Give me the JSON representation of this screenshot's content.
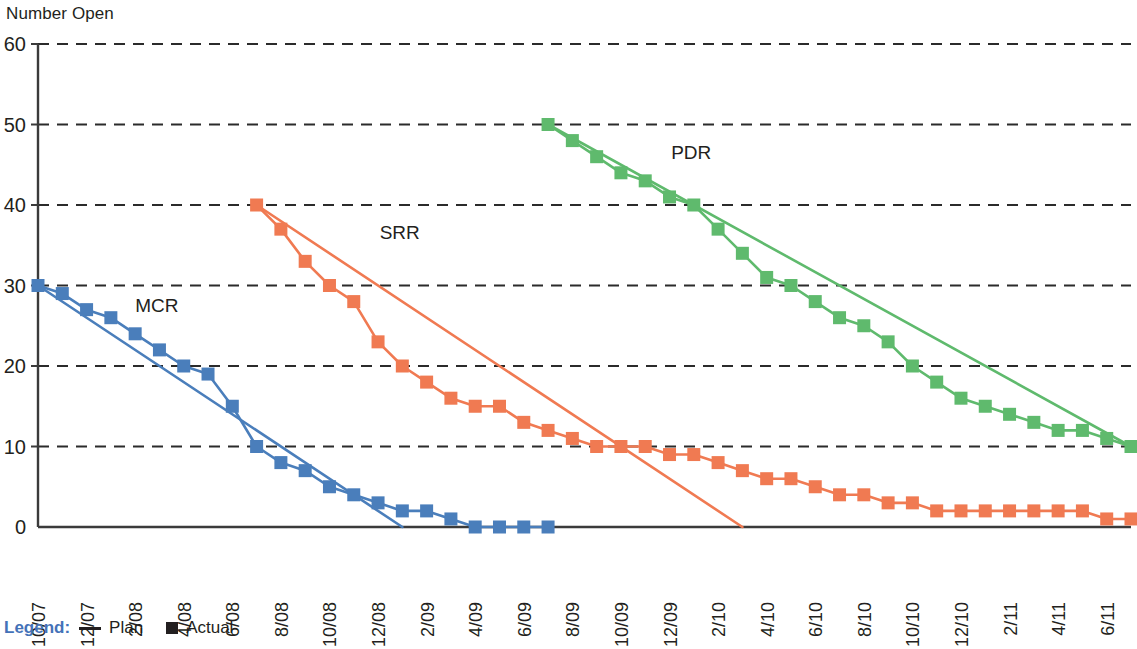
{
  "chart_data": {
    "type": "line",
    "title": "",
    "ylabel": "Number Open",
    "xlabel": "",
    "ylim": [
      0,
      60
    ],
    "yticks": [
      0,
      10,
      20,
      30,
      40,
      50,
      60
    ],
    "grid": "horizontal-dashed",
    "legend_position": "below-left",
    "x": [
      "10/07",
      "11/07",
      "12/07",
      "1/08",
      "2/08",
      "3/08",
      "4/08",
      "5/08",
      "6/08",
      "7/08",
      "8/08",
      "9/08",
      "10/08",
      "11/08",
      "12/08",
      "1/09",
      "2/09",
      "3/09",
      "4/09",
      "5/09",
      "6/09",
      "7/09",
      "8/09",
      "9/09",
      "10/09",
      "11/09",
      "12/09",
      "1/10",
      "2/10",
      "3/10",
      "4/10",
      "5/10",
      "6/10",
      "7/10",
      "8/10",
      "9/10",
      "10/10",
      "11/10",
      "12/10",
      "1/11",
      "2/11",
      "3/11",
      "4/11",
      "5/11",
      "6/11",
      "7/11"
    ],
    "xticks": [
      "10/07",
      "12/07",
      "2/08",
      "4/08",
      "6/08",
      "8/08",
      "10/08",
      "12/08",
      "2/09",
      "4/09",
      "6/09",
      "8/09",
      "10/09",
      "12/09",
      "2/10",
      "4/10",
      "6/10",
      "8/10",
      "10/10",
      "12/10",
      "2/11",
      "4/11",
      "6/11"
    ],
    "series": [
      {
        "name": "MCR",
        "label": "MCR",
        "color": "#4a7ebb",
        "kind": "actual",
        "marker": "square",
        "start_x": "10/07",
        "points": [
          {
            "x": "10/07",
            "y": 30
          },
          {
            "x": "11/07",
            "y": 29
          },
          {
            "x": "12/07",
            "y": 27
          },
          {
            "x": "1/08",
            "y": 26
          },
          {
            "x": "2/08",
            "y": 24
          },
          {
            "x": "3/08",
            "y": 22
          },
          {
            "x": "4/08",
            "y": 20
          },
          {
            "x": "5/08",
            "y": 19
          },
          {
            "x": "6/08",
            "y": 15
          },
          {
            "x": "7/08",
            "y": 10
          },
          {
            "x": "8/08",
            "y": 8
          },
          {
            "x": "9/08",
            "y": 7
          },
          {
            "x": "10/08",
            "y": 5
          },
          {
            "x": "11/08",
            "y": 4
          },
          {
            "x": "12/08",
            "y": 3
          },
          {
            "x": "1/09",
            "y": 2
          },
          {
            "x": "2/09",
            "y": 2
          },
          {
            "x": "3/09",
            "y": 1
          },
          {
            "x": "4/09",
            "y": 0
          },
          {
            "x": "5/09",
            "y": 0
          },
          {
            "x": "6/09",
            "y": 0
          },
          {
            "x": "7/09",
            "y": 0
          }
        ],
        "plan": [
          {
            "x": "10/07",
            "y": 30
          },
          {
            "x": "1/09",
            "y": 0
          }
        ],
        "label_x": "1/08",
        "label_y": 27
      },
      {
        "name": "SRR",
        "label": "SRR",
        "color": "#f07a52",
        "kind": "actual",
        "marker": "square",
        "start_x": "7/08",
        "points": [
          {
            "x": "7/08",
            "y": 40
          },
          {
            "x": "8/08",
            "y": 37
          },
          {
            "x": "9/08",
            "y": 33
          },
          {
            "x": "10/08",
            "y": 30
          },
          {
            "x": "11/08",
            "y": 28
          },
          {
            "x": "12/08",
            "y": 23
          },
          {
            "x": "1/09",
            "y": 20
          },
          {
            "x": "2/09",
            "y": 18
          },
          {
            "x": "3/09",
            "y": 16
          },
          {
            "x": "4/09",
            "y": 15
          },
          {
            "x": "5/09",
            "y": 15
          },
          {
            "x": "6/09",
            "y": 13
          },
          {
            "x": "7/09",
            "y": 12
          },
          {
            "x": "8/09",
            "y": 11
          },
          {
            "x": "9/09",
            "y": 10
          },
          {
            "x": "10/09",
            "y": 10
          },
          {
            "x": "11/09",
            "y": 10
          },
          {
            "x": "12/09",
            "y": 9
          },
          {
            "x": "1/10",
            "y": 9
          },
          {
            "x": "2/10",
            "y": 8
          },
          {
            "x": "3/10",
            "y": 7
          },
          {
            "x": "4/10",
            "y": 6
          },
          {
            "x": "5/10",
            "y": 6
          },
          {
            "x": "6/10",
            "y": 5
          },
          {
            "x": "7/10",
            "y": 4
          },
          {
            "x": "8/10",
            "y": 4
          },
          {
            "x": "9/10",
            "y": 3
          },
          {
            "x": "10/10",
            "y": 3
          },
          {
            "x": "11/10",
            "y": 2
          },
          {
            "x": "12/10",
            "y": 2
          },
          {
            "x": "1/11",
            "y": 2
          },
          {
            "x": "2/11",
            "y": 2
          },
          {
            "x": "3/11",
            "y": 2
          },
          {
            "x": "4/11",
            "y": 2
          },
          {
            "x": "5/11",
            "y": 2
          },
          {
            "x": "6/11",
            "y": 1
          },
          {
            "x": "7/11",
            "y": 1
          }
        ],
        "plan": [
          {
            "x": "7/08",
            "y": 40
          },
          {
            "x": "3/10",
            "y": 0
          }
        ],
        "label_x": "11/08",
        "label_y": 36
      },
      {
        "name": "PDR",
        "label": "PDR",
        "color": "#5fba6d",
        "kind": "actual",
        "marker": "square",
        "start_x": "7/09",
        "points": [
          {
            "x": "7/09",
            "y": 50
          },
          {
            "x": "8/09",
            "y": 48
          },
          {
            "x": "9/09",
            "y": 46
          },
          {
            "x": "10/09",
            "y": 44
          },
          {
            "x": "11/09",
            "y": 43
          },
          {
            "x": "12/09",
            "y": 41
          },
          {
            "x": "1/10",
            "y": 40
          },
          {
            "x": "2/10",
            "y": 37
          },
          {
            "x": "3/10",
            "y": 34
          },
          {
            "x": "4/10",
            "y": 31
          },
          {
            "x": "5/10",
            "y": 30
          },
          {
            "x": "6/10",
            "y": 28
          },
          {
            "x": "7/10",
            "y": 26
          },
          {
            "x": "8/10",
            "y": 25
          },
          {
            "x": "9/10",
            "y": 23
          },
          {
            "x": "10/10",
            "y": 20
          },
          {
            "x": "11/10",
            "y": 18
          },
          {
            "x": "12/10",
            "y": 16
          },
          {
            "x": "1/11",
            "y": 15
          },
          {
            "x": "2/11",
            "y": 14
          },
          {
            "x": "3/11",
            "y": 13
          },
          {
            "x": "4/11",
            "y": 12
          },
          {
            "x": "5/11",
            "y": 12
          },
          {
            "x": "6/11",
            "y": 11
          },
          {
            "x": "7/11",
            "y": 10
          }
        ],
        "plan": [
          {
            "x": "7/09",
            "y": 50
          },
          {
            "x": "7/11",
            "y": 10
          }
        ],
        "label_x": "11/09",
        "label_y": 46
      }
    ]
  },
  "legend": {
    "title": "Legend:",
    "plan_label": "Plan",
    "actual_label": "Actual",
    "plan_icon": "line-swatch-icon",
    "actual_icon": "square-swatch-icon"
  },
  "colors": {
    "mcr": "#4a7ebb",
    "srr": "#f07a52",
    "pdr": "#5fba6d",
    "axis": "#3b3b3b",
    "grid": "#2b2b2b",
    "legend_title": "#4472b8",
    "text": "#231f20"
  }
}
